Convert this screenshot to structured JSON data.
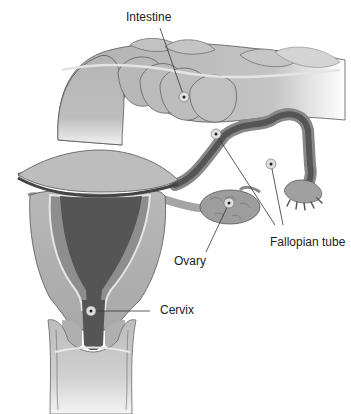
{
  "diagram": {
    "labels": {
      "intestine": "Intestine",
      "fallopian_tube": "Fallopian tube",
      "ovary": "Ovary",
      "cervix": "Cervix"
    },
    "colors": {
      "background": "#ffffff",
      "tissue_light": "#c8c8c8",
      "tissue_mid": "#a8a8a8",
      "tissue_dark": "#555555",
      "outline": "#444444",
      "leader_line": "#333333",
      "text": "#222222"
    }
  }
}
